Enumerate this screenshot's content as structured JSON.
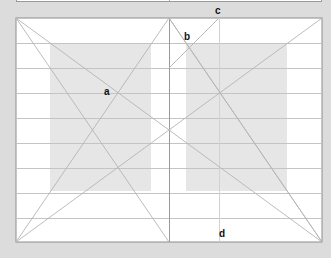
{
  "diagram": {
    "labels": {
      "a": "a",
      "b": "b",
      "c": "c",
      "d": "d"
    },
    "colors": {
      "background": "#dcdcdc",
      "page": "#ffffff",
      "text_block": "#e6e6e6",
      "lines": "#b4b4b4",
      "border": "#8c8c8c",
      "label": "#111111"
    },
    "spread": {
      "x": 16,
      "y": 18,
      "width": 306,
      "height": 224,
      "spine_x": 169
    },
    "grid_rows": 9,
    "text_blocks": [
      {
        "page": "left",
        "x": 50,
        "y": 43,
        "width": 101,
        "height": 148
      },
      {
        "page": "right",
        "x": 186,
        "y": 43,
        "width": 101,
        "height": 148
      }
    ],
    "vertical_guide_x": 219
  }
}
